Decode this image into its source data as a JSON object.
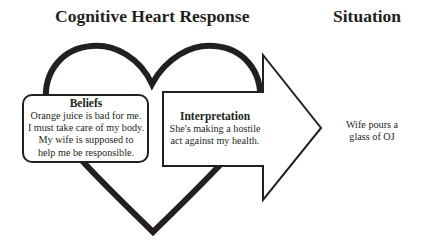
{
  "titles": {
    "left": "Cognitive Heart Response",
    "right": "Situation"
  },
  "beliefs": {
    "heading": "Beliefs",
    "lines": [
      "Orange juice is bad for me.",
      "I must take care of my body.",
      "My wife is supposed to",
      "help me be responsible."
    ]
  },
  "interpretation": {
    "heading": "Interpretation",
    "lines": [
      "She's making a hostile",
      "act against my health."
    ]
  },
  "situation": {
    "lines": [
      "Wife pours a",
      "glass of OJ"
    ]
  },
  "colors": {
    "stroke": "#231f20",
    "background": "#ffffff"
  },
  "icons": {
    "heart": "heart-outline-icon",
    "arrow": "right-arrow-icon"
  }
}
